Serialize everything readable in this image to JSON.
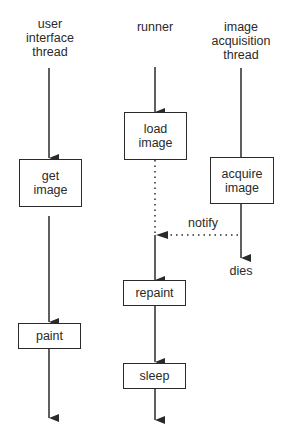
{
  "diagram": {
    "threads": [
      {
        "id": "ui",
        "label_lines": [
          "user",
          "interface",
          "thread"
        ]
      },
      {
        "id": "runner",
        "label_lines": [
          "runner"
        ]
      },
      {
        "id": "acq",
        "label_lines": [
          "image",
          "acquisition",
          "thread"
        ]
      }
    ],
    "boxes": {
      "get_image": [
        "get",
        "image"
      ],
      "paint": "paint",
      "load_image": [
        "load",
        "image"
      ],
      "repaint": "repaint",
      "sleep": "sleep",
      "acquire_image": [
        "acquire",
        "image"
      ]
    },
    "annotations": {
      "notify": "notify",
      "dies": "dies"
    },
    "colors": {
      "stroke": "#2a2a2a",
      "background": "#ffffff"
    }
  }
}
